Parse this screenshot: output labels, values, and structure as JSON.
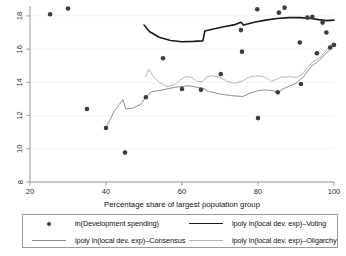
{
  "chart_data": {
    "type": "scatter",
    "title": "",
    "xlabel": "Percentage share of largest population group",
    "ylabel": "",
    "xlim": [
      20,
      100
    ],
    "ylim": [
      8,
      18.6
    ],
    "xticks": [
      20,
      40,
      60,
      80,
      100
    ],
    "yticks": [
      8,
      10,
      12,
      14,
      16,
      18
    ],
    "grid": "horizontal-faint",
    "legend_position": "below-axes",
    "scatter": {
      "name": "ln(Development spending)",
      "marker": "filled-circle",
      "color": "#3c3c3c",
      "points": [
        [
          25.3,
          18.1
        ],
        [
          30.0,
          18.45
        ],
        [
          35.0,
          12.4
        ],
        [
          40.0,
          11.25
        ],
        [
          45.0,
          9.78
        ],
        [
          50.5,
          13.1
        ],
        [
          55.0,
          15.45
        ],
        [
          60.0,
          13.6
        ],
        [
          65.0,
          13.55
        ],
        [
          70.2,
          14.5
        ],
        [
          75.5,
          17.15
        ],
        [
          75.8,
          15.85
        ],
        [
          79.8,
          18.4
        ],
        [
          80.0,
          11.85
        ],
        [
          85.5,
          18.2
        ],
        [
          85.2,
          13.4
        ],
        [
          87.0,
          18.5
        ],
        [
          91.0,
          16.4
        ],
        [
          91.3,
          13.9
        ],
        [
          93.0,
          17.9
        ],
        [
          94.3,
          17.95
        ],
        [
          95.5,
          15.75
        ],
        [
          97.0,
          17.6
        ],
        [
          98.0,
          17.0
        ],
        [
          99.0,
          16.1
        ],
        [
          100.0,
          16.25
        ]
      ]
    },
    "series": [
      {
        "name": "lpoly ln(local dev. exp)–Voting",
        "color": "#1b1b1b",
        "width": 1.6,
        "points": [
          [
            50.0,
            17.45
          ],
          [
            51.5,
            17.05
          ],
          [
            54.0,
            16.72
          ],
          [
            57.0,
            16.52
          ],
          [
            60.0,
            16.45
          ],
          [
            63.0,
            16.47
          ],
          [
            65.5,
            16.5
          ],
          [
            66.0,
            17.1
          ],
          [
            68.0,
            17.2
          ],
          [
            71.0,
            17.35
          ],
          [
            74.0,
            17.48
          ],
          [
            75.5,
            17.62
          ],
          [
            76.2,
            17.45
          ],
          [
            79.0,
            17.62
          ],
          [
            82.0,
            17.75
          ],
          [
            85.0,
            17.85
          ],
          [
            88.0,
            17.9
          ],
          [
            91.0,
            17.9
          ],
          [
            94.0,
            17.85
          ],
          [
            96.0,
            17.78
          ],
          [
            98.0,
            17.72
          ],
          [
            100.0,
            17.75
          ]
        ]
      },
      {
        "name": "lpoly ln(local dev. exp)–Consensus",
        "color": "#8d8d8d",
        "width": 1.0,
        "points": [
          [
            40.0,
            11.28
          ],
          [
            41.0,
            11.7
          ],
          [
            42.0,
            12.2
          ],
          [
            43.5,
            12.68
          ],
          [
            44.5,
            12.95
          ],
          [
            45.2,
            12.4
          ],
          [
            47.0,
            12.45
          ],
          [
            49.0,
            12.65
          ],
          [
            50.5,
            13.1
          ],
          [
            52.0,
            13.45
          ],
          [
            54.0,
            13.5
          ],
          [
            56.0,
            13.6
          ],
          [
            58.0,
            13.7
          ],
          [
            60.0,
            13.75
          ],
          [
            62.0,
            13.8
          ],
          [
            64.0,
            13.7
          ],
          [
            65.5,
            13.65
          ],
          [
            67.0,
            13.45
          ],
          [
            70.0,
            13.3
          ],
          [
            73.0,
            13.2
          ],
          [
            76.0,
            13.15
          ],
          [
            78.0,
            13.35
          ],
          [
            80.0,
            13.5
          ],
          [
            82.0,
            13.55
          ],
          [
            84.0,
            13.5
          ],
          [
            85.5,
            13.4
          ],
          [
            86.5,
            13.6
          ],
          [
            88.0,
            13.75
          ],
          [
            90.0,
            13.95
          ],
          [
            92.0,
            14.35
          ],
          [
            94.0,
            14.95
          ],
          [
            96.0,
            15.3
          ],
          [
            97.5,
            15.65
          ],
          [
            99.0,
            16.0
          ],
          [
            100.0,
            16.3
          ]
        ]
      },
      {
        "name": "lpoly ln(local dev. exp)–Oligarchy",
        "color": "#b5b5b5",
        "width": 1.0,
        "points": [
          [
            50.5,
            14.35
          ],
          [
            51.2,
            14.8
          ],
          [
            52.5,
            14.35
          ],
          [
            54.0,
            14.0
          ],
          [
            56.0,
            13.75
          ],
          [
            58.0,
            13.85
          ],
          [
            59.5,
            14.15
          ],
          [
            61.0,
            14.35
          ],
          [
            62.5,
            14.3
          ],
          [
            64.0,
            14.05
          ],
          [
            65.5,
            14.05
          ],
          [
            66.5,
            14.35
          ],
          [
            68.0,
            14.4
          ],
          [
            70.0,
            14.3
          ],
          [
            72.0,
            14.05
          ],
          [
            74.0,
            13.95
          ],
          [
            76.0,
            14.1
          ],
          [
            78.0,
            14.35
          ],
          [
            80.0,
            14.4
          ],
          [
            82.0,
            14.3
          ],
          [
            83.5,
            14.05
          ],
          [
            84.5,
            14.15
          ],
          [
            86.0,
            14.3
          ],
          [
            88.0,
            14.35
          ],
          [
            90.0,
            14.3
          ],
          [
            91.5,
            14.45
          ],
          [
            93.0,
            14.9
          ],
          [
            94.5,
            15.25
          ],
          [
            96.0,
            15.45
          ],
          [
            97.5,
            15.8
          ],
          [
            99.0,
            16.25
          ],
          [
            100.0,
            16.4
          ]
        ]
      }
    ]
  },
  "legend": {
    "entries": [
      {
        "key": "dot",
        "label": "ln(Development spending)"
      },
      {
        "key": "line-voting",
        "label": "lpoly ln(local dev. exp)–Voting"
      },
      {
        "key": "line-consensus",
        "label": "lpoly ln(local dev. exp)–Consensus"
      },
      {
        "key": "line-oligarchy",
        "label": "lpoly ln(local dev. exp)–Oligarchy"
      }
    ]
  },
  "axes": {
    "x_title": "Percentage share of largest population group",
    "x_tick_labels": [
      "20",
      "40",
      "60",
      "80",
      "100"
    ],
    "y_tick_labels": [
      "8",
      "10",
      "12",
      "14",
      "16",
      "18"
    ]
  }
}
